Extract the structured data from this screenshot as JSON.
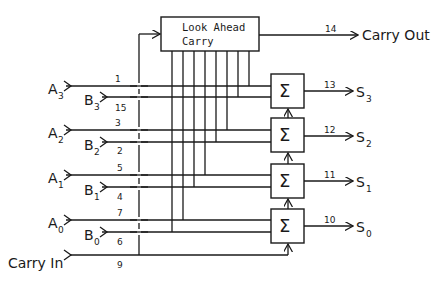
{
  "diagram": {
    "look_ahead_box": {
      "line1": "Look Ahead",
      "line2": "Carry"
    },
    "carry_out": {
      "label": "Carry Out",
      "pin": "14"
    },
    "carry_in": {
      "label": "Carry In",
      "pin": "9"
    },
    "inputs": [
      {
        "name": "A",
        "sub": "3",
        "pin": "1"
      },
      {
        "name": "B",
        "sub": "3",
        "pin": "15"
      },
      {
        "name": "A",
        "sub": "2",
        "pin": "3"
      },
      {
        "name": "B",
        "sub": "2",
        "pin": "2"
      },
      {
        "name": "A",
        "sub": "1",
        "pin": "5"
      },
      {
        "name": "B",
        "sub": "1",
        "pin": "4"
      },
      {
        "name": "A",
        "sub": "0",
        "pin": "7"
      },
      {
        "name": "B",
        "sub": "0",
        "pin": "6"
      }
    ],
    "adders": [
      {
        "symbol": "Σ",
        "out_name": "S",
        "out_sub": "3",
        "pin": "13"
      },
      {
        "symbol": "Σ",
        "out_name": "S",
        "out_sub": "2",
        "pin": "12"
      },
      {
        "symbol": "Σ",
        "out_name": "S",
        "out_sub": "1",
        "pin": "11"
      },
      {
        "symbol": "Σ",
        "out_name": "S",
        "out_sub": "0",
        "pin": "10"
      }
    ]
  }
}
